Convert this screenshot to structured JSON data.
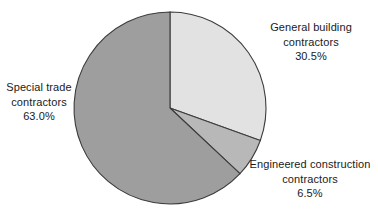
{
  "chart_data": {
    "type": "pie",
    "title": "",
    "subtitle": "",
    "xlabel": "",
    "ylabel": "",
    "legend_position": "none",
    "grid": false,
    "unit": "percent",
    "start_angle_deg": 0,
    "direction": "clockwise",
    "categories": [
      "General building contractors",
      "Engineered construction contractors",
      "Special trade contractors"
    ],
    "values": [
      30.5,
      6.5,
      63.0
    ],
    "slices": [
      {
        "label_line_1": "General building",
        "label_line_2": "contractors",
        "value_text": "30.5%",
        "value": 30.5,
        "color": "#e2e2e2",
        "start_deg": 0.0,
        "end_deg": 109.8
      },
      {
        "label_line_1": "Engineered construction",
        "label_line_2": "contractors",
        "value_text": "6.5%",
        "value": 6.5,
        "color": "#b8b8b8",
        "start_deg": 109.8,
        "end_deg": 133.2
      },
      {
        "label_line_1": "Special trade",
        "label_line_2": "contractors",
        "value_text": "63.0%",
        "value": 63.0,
        "color": "#9e9e9e",
        "start_deg": 133.2,
        "end_deg": 360.0
      }
    ],
    "stroke_color": "#3c3c3c",
    "background_color": "#ffffff"
  }
}
